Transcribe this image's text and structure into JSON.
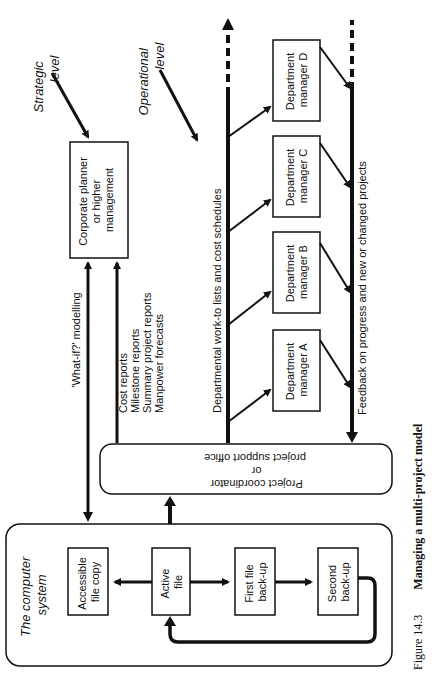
{
  "caption": {
    "figure": "Figure 14.3",
    "title": "Managing a multi-project model"
  },
  "levels": {
    "strategic": [
      "Strategic",
      "level"
    ],
    "operational": [
      "Operational",
      "level"
    ]
  },
  "computer_system": {
    "title": [
      "The computer",
      "system"
    ],
    "accessible_copy": [
      "Accessible",
      "file copy"
    ],
    "active_file": [
      "Active",
      "file"
    ],
    "first_backup": [
      "First file",
      "back-up"
    ],
    "second_backup": [
      "Second",
      "back-up"
    ]
  },
  "coordinator": [
    "Project coordinator",
    "or",
    "project support office"
  ],
  "corporate": [
    "Corporate planner",
    "or higher",
    "management"
  ],
  "what_if": "'What-if?' modelling",
  "reports": [
    "Cost reports",
    "Milestone reports",
    "Summary project reports",
    "Manpower forecasts"
  ],
  "worklists": "Departmental work-to lists and cost schedules",
  "feedback": "Feedback on progress and new or changed projects",
  "departments": [
    [
      "Department",
      "manager A"
    ],
    [
      "Department",
      "manager B"
    ],
    [
      "Department",
      "manager C"
    ],
    [
      "Department",
      "manager D"
    ]
  ]
}
